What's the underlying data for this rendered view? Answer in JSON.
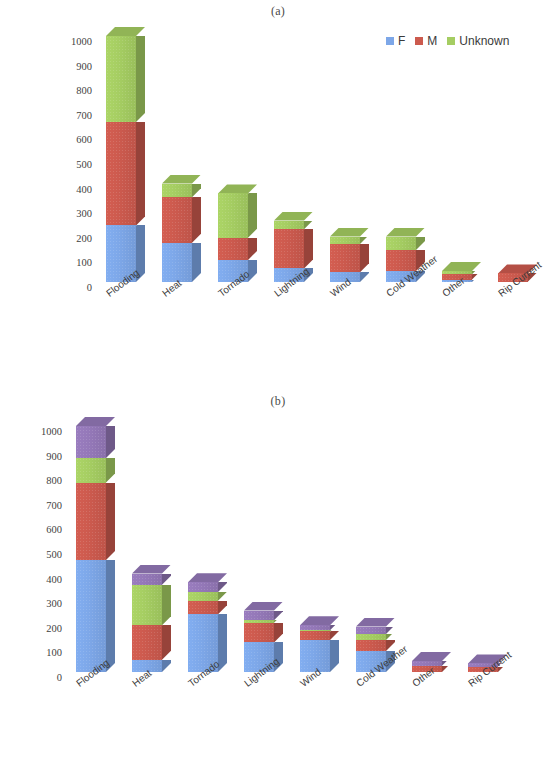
{
  "figure": {
    "panels": [
      {
        "id": "a",
        "title": "(a)",
        "legend_position": "top-right",
        "legend": [
          {
            "label": "F",
            "color": "#7da7e8"
          },
          {
            "label": "M",
            "color": "#cc5a4e"
          },
          {
            "label": "Unknown",
            "color": "#a5cd62"
          }
        ]
      },
      {
        "id": "b",
        "title": "(b)",
        "legend_position": "top-right",
        "legend": [
          {
            "label": "Unknown",
            "color": "#7da7e8"
          },
          {
            "label": "adult (18-64)",
            "color": "#cc5a4e"
          },
          {
            "label": "elderly (≥65)",
            "color": "#a5cd62"
          },
          {
            "label": "child (0-17)",
            "color": "#9478b8"
          }
        ]
      }
    ]
  },
  "chart_data": [
    {
      "type": "bar",
      "stacked": true,
      "three_d": true,
      "title": "(a)",
      "xlabel": "",
      "ylabel": "",
      "ylim": [
        0,
        1000
      ],
      "yticks": [
        0,
        100,
        200,
        300,
        400,
        500,
        600,
        700,
        800,
        900,
        1000
      ],
      "ytick_labels": [
        "0",
        "100",
        "200",
        "300",
        "400",
        "500",
        "600",
        "700",
        "800",
        "900",
        "1000"
      ],
      "grid": false,
      "legend_position": "top-right",
      "categories": [
        "Flooding",
        "Heat",
        "Tornado",
        "Lightning",
        "Wind",
        "Cold Weather",
        "Other",
        "Rip Current"
      ],
      "series": [
        {
          "name": "F",
          "color": "#7da7e8",
          "values": [
            230,
            160,
            90,
            55,
            40,
            45,
            10,
            2
          ]
        },
        {
          "name": "M",
          "color": "#cc5a4e",
          "values": [
            420,
            185,
            90,
            160,
            115,
            85,
            22,
            33
          ]
        },
        {
          "name": "Unknown",
          "color": "#a5cd62",
          "values": [
            350,
            55,
            180,
            35,
            30,
            55,
            13,
            0
          ]
        }
      ],
      "totals": [
        1000,
        400,
        360,
        250,
        185,
        185,
        45,
        35
      ]
    },
    {
      "type": "bar",
      "stacked": true,
      "three_d": true,
      "title": "(b)",
      "xlabel": "",
      "ylabel": "",
      "ylim": [
        0,
        1000
      ],
      "yticks": [
        0,
        100,
        200,
        300,
        400,
        500,
        600,
        700,
        800,
        900,
        1000
      ],
      "ytick_labels": [
        "0",
        "100",
        "200",
        "300",
        "400",
        "500",
        "600",
        "700",
        "800",
        "900",
        "1000"
      ],
      "grid": false,
      "legend_position": "top-right",
      "categories": [
        "Flooding",
        "Heat",
        "Tornado",
        "Lightning",
        "Wind",
        "Cold Weather",
        "Other",
        "Rip Current"
      ],
      "series": [
        {
          "name": "Unknown",
          "color": "#7da7e8",
          "values": [
            455,
            50,
            235,
            120,
            130,
            85,
            0,
            0
          ]
        },
        {
          "name": "adult (18-64)",
          "color": "#cc5a4e",
          "values": [
            315,
            140,
            55,
            80,
            35,
            45,
            25,
            22
          ]
        },
        {
          "name": "elderly (≥65)",
          "color": "#a5cd62",
          "values": [
            100,
            165,
            35,
            10,
            5,
            25,
            0,
            0
          ]
        },
        {
          "name": "child (0-17)",
          "color": "#9478b8",
          "values": [
            130,
            45,
            40,
            40,
            20,
            30,
            20,
            13
          ]
        }
      ],
      "totals": [
        1000,
        400,
        365,
        250,
        190,
        185,
        45,
        35
      ]
    }
  ]
}
